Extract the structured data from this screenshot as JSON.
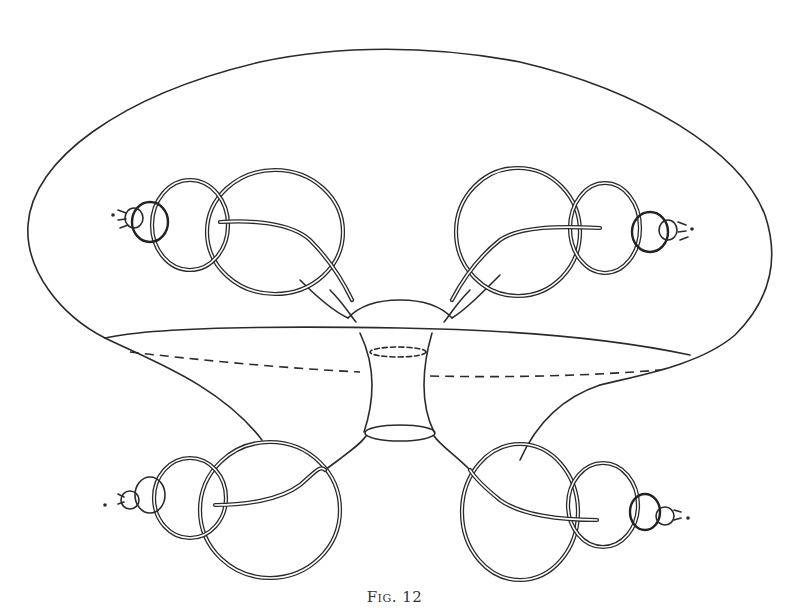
{
  "figure": {
    "caption": "Fig. 12",
    "colors": {
      "ink": "#2a2a2a",
      "paper": "#ffffff"
    },
    "parts": [
      "outer-surface",
      "equatorial-disc",
      "central-neck-tube",
      "upper-left-horn",
      "upper-right-horn",
      "lower-left-horn",
      "lower-right-horn"
    ]
  }
}
